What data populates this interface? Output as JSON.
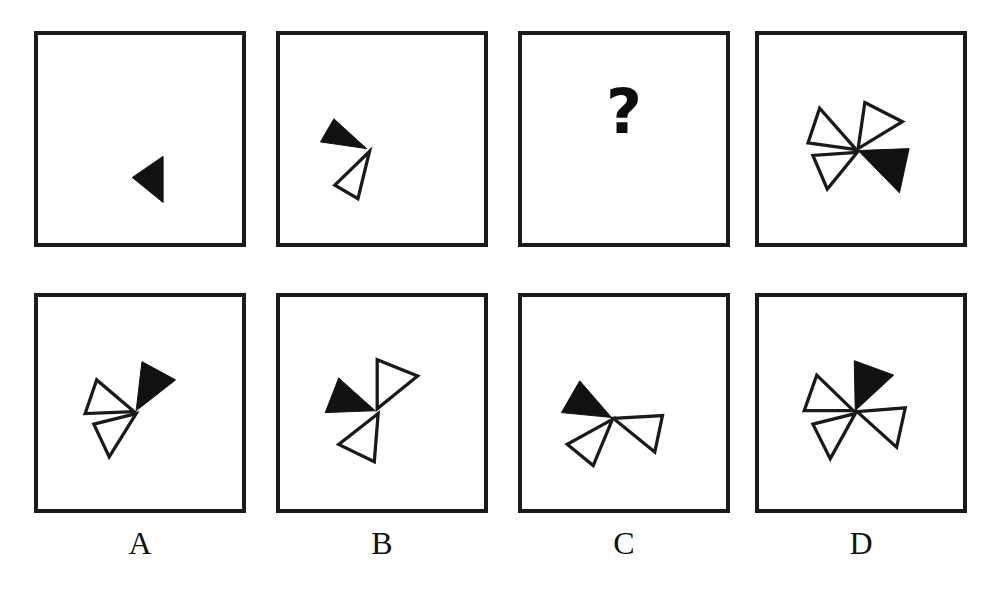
{
  "puzzle": {
    "type": "visual-analogy-matrix",
    "question_mark": "?",
    "sequence_row": {
      "name": "sequence",
      "panels": [
        {
          "id": "seq-1",
          "triangle_count": 1,
          "filled_count": 1,
          "outline_count": 0,
          "triangles": [
            {
              "fill": "black",
              "angle": 180,
              "label": "black-triangle-pointing-left"
            }
          ]
        },
        {
          "id": "seq-2",
          "triangle_count": 2,
          "filled_count": 1,
          "outline_count": 1,
          "triangles": [
            {
              "fill": "black",
              "angle": 160,
              "label": "black-triangle-pointing-upper-left"
            },
            {
              "fill": "white",
              "angle": 232,
              "label": "outline-triangle-pointing-lower-left"
            }
          ]
        },
        {
          "id": "seq-3",
          "triangle_count": 0,
          "filled_count": 0,
          "outline_count": 0,
          "is_question": true,
          "triangles": []
        },
        {
          "id": "seq-4",
          "triangle_count": 4,
          "filled_count": 1,
          "outline_count": 3,
          "triangles": [
            {
              "fill": "black",
              "angle": 10,
              "label": "black-triangle-pointing-right"
            },
            {
              "fill": "white",
              "angle": 78,
              "label": "outline-triangle-pointing-up"
            },
            {
              "fill": "white",
              "angle": 168,
              "label": "outline-triangle-pointing-left"
            },
            {
              "fill": "white",
              "angle": 248,
              "label": "outline-triangle-pointing-down-left"
            }
          ]
        }
      ]
    },
    "options_row": {
      "name": "answer-options",
      "labels": [
        "A",
        "B",
        "C",
        "D"
      ],
      "panels": [
        {
          "id": "opt-A",
          "label": "A",
          "triangle_count": 3,
          "filled_count": 1,
          "outline_count": 2,
          "triangles": [
            {
              "fill": "black",
              "angle": 62,
              "label": "black-triangle-pointing-up-right"
            },
            {
              "fill": "white",
              "angle": 170,
              "label": "outline-triangle-pointing-left"
            },
            {
              "fill": "white",
              "angle": 250,
              "label": "outline-triangle-pointing-down-left"
            }
          ]
        },
        {
          "id": "opt-B",
          "label": "B",
          "triangle_count": 3,
          "filled_count": 1,
          "outline_count": 2,
          "triangles": [
            {
              "fill": "black",
              "angle": 172,
              "label": "black-triangle-pointing-left"
            },
            {
              "fill": "white",
              "angle": 52,
              "label": "outline-triangle-pointing-up-right"
            },
            {
              "fill": "white",
              "angle": 244,
              "label": "outline-triangle-pointing-down-left"
            }
          ]
        },
        {
          "id": "opt-C",
          "label": "C",
          "triangle_count": 3,
          "filled_count": 1,
          "outline_count": 2,
          "triangles": [
            {
              "fill": "black",
              "angle": 160,
              "label": "black-triangle-pointing-upper-left"
            },
            {
              "fill": "white",
              "angle": 8,
              "label": "outline-triangle-pointing-right"
            },
            {
              "fill": "white",
              "angle": 234,
              "label": "outline-triangle-pointing-down-left"
            }
          ]
        },
        {
          "id": "opt-D",
          "label": "D",
          "triangle_count": 4,
          "filled_count": 1,
          "outline_count": 3,
          "triangles": [
            {
              "fill": "black",
              "angle": 72,
              "label": "black-triangle-pointing-up"
            },
            {
              "fill": "white",
              "angle": 166,
              "label": "outline-triangle-pointing-left"
            },
            {
              "fill": "white",
              "angle": 352,
              "label": "outline-triangle-pointing-right"
            },
            {
              "fill": "white",
              "angle": 250,
              "label": "outline-triangle-pointing-down-left"
            }
          ]
        }
      ]
    },
    "colors": {
      "filled": "#111111",
      "outline_stroke": "#1a1a1a",
      "panel_border": "#1a1a1a",
      "background": "#ffffff"
    }
  }
}
